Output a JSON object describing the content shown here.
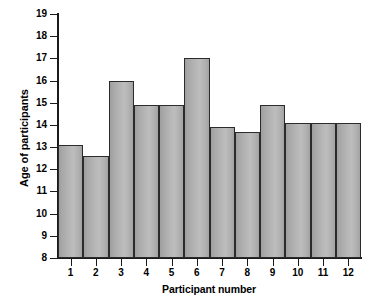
{
  "chart_data": {
    "type": "bar",
    "title": "",
    "xlabel": "Participant number",
    "ylabel": "Age of participants",
    "categories": [
      "1",
      "2",
      "3",
      "4",
      "5",
      "6",
      "7",
      "8",
      "9",
      "10",
      "11",
      "12"
    ],
    "values": [
      13.1,
      12.6,
      16.0,
      14.9,
      14.9,
      17.0,
      13.9,
      13.7,
      14.9,
      14.1,
      14.1,
      14.1
    ],
    "ylim": [
      8,
      19
    ],
    "yticks": [
      8,
      9,
      10,
      11,
      12,
      13,
      14,
      15,
      16,
      17,
      18,
      19
    ],
    "ytick_labels": [
      "8",
      "9",
      "10",
      "11",
      "12",
      "13",
      "14",
      "15",
      "16",
      "17",
      "18",
      "19"
    ],
    "grid": false,
    "legend": null,
    "bar_fill": "#b3b3b3",
    "bar_edge": "#2b2b2b",
    "axis_color": "#1a1a1a",
    "background": "#ffffff"
  }
}
